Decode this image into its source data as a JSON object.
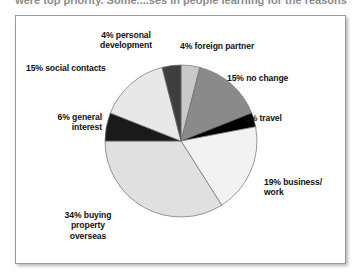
{
  "headline": "were top priority. Some....ses in people learning for the reasons",
  "chart_data": {
    "type": "pie",
    "title": "",
    "start_angle_deg": 0,
    "direction": "clockwise",
    "legend": "none",
    "labels_inline": true,
    "categories": [
      "foreign partner",
      "no change",
      "travel",
      "business/work",
      "buying property overseas",
      "general interest",
      "social contacts",
      "personal development"
    ],
    "values": [
      4,
      15,
      3,
      19,
      34,
      6,
      15,
      4
    ],
    "unit": "%",
    "colors": [
      "#c9c9c9",
      "#8a8a8a",
      "#000000",
      "#f2f2f2",
      "#e0e0e0",
      "#1a1a1a",
      "#e8e8e8",
      "#3f3f3f"
    ],
    "slices": [
      {
        "label": "4% foreign partner",
        "value": 4,
        "color": "#c9c9c9"
      },
      {
        "label": "15% no change",
        "value": 15,
        "color": "#8a8a8a"
      },
      {
        "label": "3% travel",
        "value": 3,
        "color": "#000000"
      },
      {
        "label": "19% business/\nwork",
        "value": 19,
        "color": "#f2f2f2"
      },
      {
        "label": "34% buying\nproperty\noverseas",
        "value": 34,
        "color": "#e0e0e0"
      },
      {
        "label": "6% general\ninterest",
        "value": 6,
        "color": "#1a1a1a"
      },
      {
        "label": "15% social contacts",
        "value": 15,
        "color": "#e8e8e8"
      },
      {
        "label": "4% personal\ndevelopment",
        "value": 4,
        "color": "#3f3f3f"
      }
    ]
  },
  "labels": {
    "personal_development": "4% personal\ndevelopment",
    "foreign_partner": "4% foreign partner",
    "social_contacts": "15% social contacts",
    "no_change": "15% no change",
    "general_interest": "6% general\ninterest",
    "travel": "3% travel",
    "business_work": "19% business/\nwork",
    "buying_property": "34% buying\nproperty\noverseas"
  }
}
